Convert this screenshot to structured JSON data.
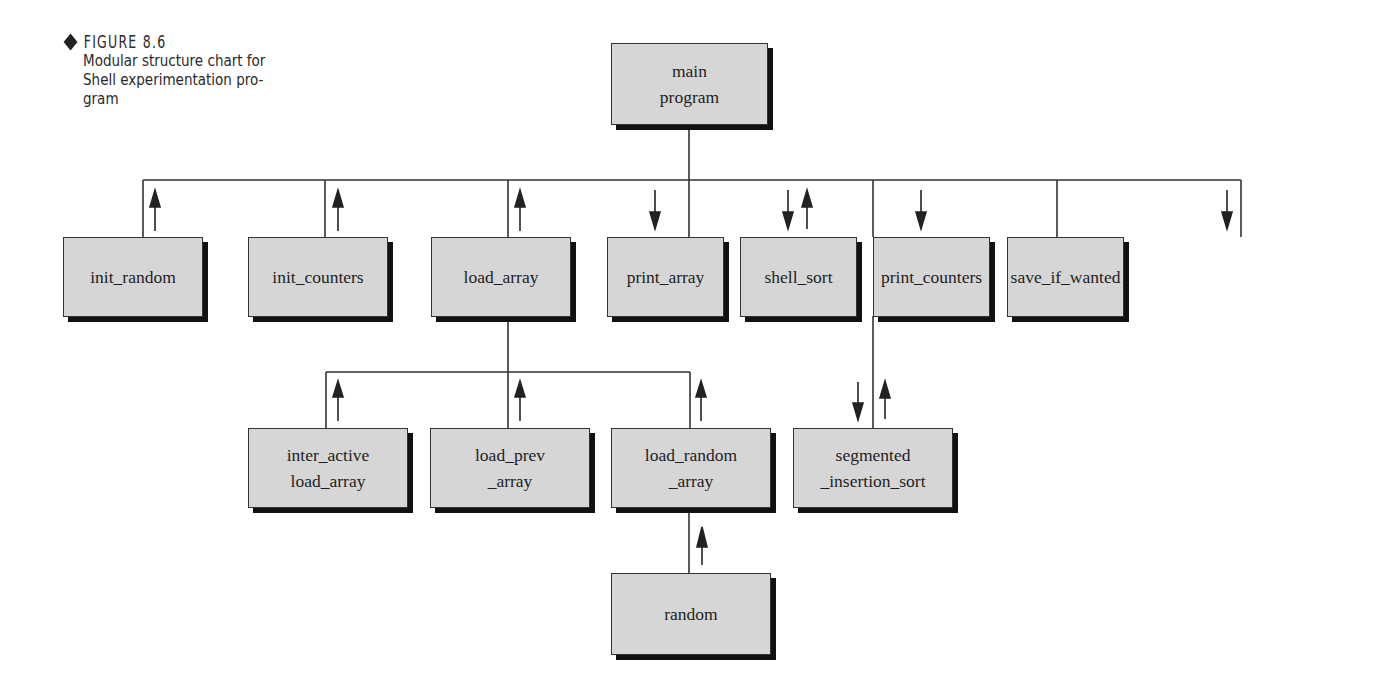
{
  "caption": {
    "label": "FIGURE 8.6",
    "text": "Modular structure chart for Shell experimentation pro-\ngram"
  },
  "colors": {
    "box_fill": "#d6d6d6",
    "box_border": "#333333",
    "shadow": "#111111",
    "line": "#333333"
  },
  "nodes": {
    "main": "main\nprogram",
    "init_random": "init_random",
    "init_counters": "init_counters",
    "load_array": "load_array",
    "print_array": "print_array",
    "shell_sort": "shell_sort",
    "print_counters": "print_counters",
    "save_if_wanted": "save_if_wanted",
    "inter_active": "inter_active\nload_array",
    "load_prev": "load_prev\n_array",
    "load_random": "load_random\n_array",
    "segmented": "segmented\n_insertion_sort",
    "random": "random"
  },
  "edges": [
    {
      "from": "main",
      "to": "init_random",
      "flow": [
        "up"
      ]
    },
    {
      "from": "main",
      "to": "init_counters",
      "flow": [
        "up"
      ]
    },
    {
      "from": "main",
      "to": "load_array",
      "flow": [
        "up"
      ]
    },
    {
      "from": "main",
      "to": "print_array",
      "flow": [
        "down"
      ]
    },
    {
      "from": "main",
      "to": "shell_sort",
      "flow": [
        "down",
        "up"
      ]
    },
    {
      "from": "main",
      "to": "print_counters",
      "flow": [
        "down"
      ]
    },
    {
      "from": "main",
      "to": "save_if_wanted",
      "flow": [
        "down"
      ]
    },
    {
      "from": "load_array",
      "to": "inter_active",
      "flow": [
        "up"
      ]
    },
    {
      "from": "load_array",
      "to": "load_prev",
      "flow": [
        "up"
      ]
    },
    {
      "from": "load_array",
      "to": "load_random",
      "flow": [
        "up"
      ]
    },
    {
      "from": "shell_sort",
      "to": "segmented",
      "flow": [
        "down",
        "up"
      ]
    },
    {
      "from": "load_random",
      "to": "random",
      "flow": [
        "up"
      ]
    }
  ]
}
